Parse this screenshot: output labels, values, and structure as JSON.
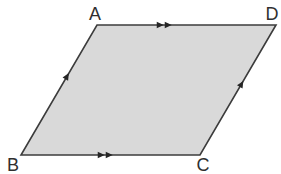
{
  "diagram": {
    "type": "parallelogram",
    "background": "#ffffff",
    "shape": {
      "fill": "#d9d9d9",
      "stroke": "#3c3c3c",
      "stroke_width": 1.6
    },
    "mark_color": "#262626",
    "label_color": "#2f2f2f",
    "vertices": [
      {
        "id": "A",
        "label": "A",
        "x": 97,
        "y": 25,
        "label_x": 95,
        "label_y": 20
      },
      {
        "id": "D",
        "label": "D",
        "x": 276,
        "y": 25,
        "label_x": 272,
        "label_y": 20
      },
      {
        "id": "C",
        "label": "C",
        "x": 200,
        "y": 155,
        "label_x": 203,
        "label_y": 171
      },
      {
        "id": "B",
        "label": "B",
        "x": 21,
        "y": 155,
        "label_x": 13,
        "label_y": 171
      }
    ],
    "parallel_marks": [
      {
        "side": "AD",
        "from": "A",
        "to": "D",
        "count": 2,
        "t": 0.37
      },
      {
        "side": "BC",
        "from": "B",
        "to": "C",
        "count": 2,
        "t": 0.465
      },
      {
        "side": "BA",
        "from": "B",
        "to": "A",
        "count": 1,
        "t": 0.6
      },
      {
        "side": "CD",
        "from": "C",
        "to": "D",
        "count": 1,
        "t": 0.54
      }
    ]
  }
}
